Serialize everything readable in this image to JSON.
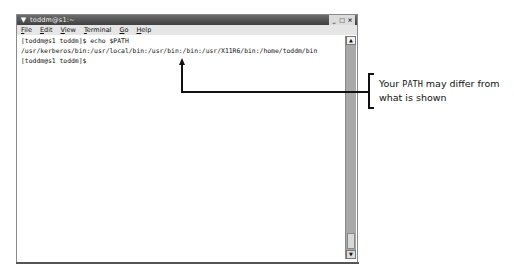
{
  "window": {
    "title": "toddm@s1:~",
    "controls": {
      "minimize": "_",
      "maximize": "□",
      "close": "×"
    },
    "menu": [
      {
        "label": "File",
        "underline": "F",
        "rest": "ile"
      },
      {
        "label": "Edit",
        "underline": "E",
        "rest": "dit"
      },
      {
        "label": "View",
        "underline": "V",
        "rest": "iew"
      },
      {
        "label": "Terminal",
        "underline": "T",
        "rest": "erminal"
      },
      {
        "label": "Go",
        "underline": "G",
        "rest": "o"
      },
      {
        "label": "Help",
        "underline": "H",
        "rest": "elp"
      }
    ],
    "terminal_lines": [
      "[toddm@s1 toddm]$ echo $PATH",
      "/usr/kerberos/bin:/usr/local/bin:/usr/bin:/bin:/usr/X11R6/bin:/home/toddm/bin",
      "[toddm@s1 toddm]$"
    ],
    "scrollbar": {
      "up": "▲",
      "down": "▼"
    }
  },
  "annotation": {
    "text_before": "Your ",
    "text_mono": "PATH",
    "text_after": " may differ from",
    "line2": "what is shown"
  }
}
